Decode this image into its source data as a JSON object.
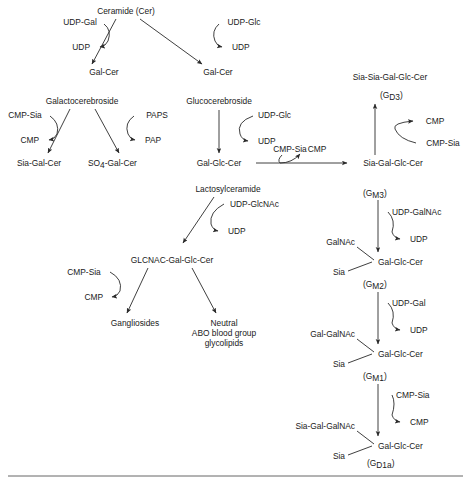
{
  "figure": {
    "background_color": "#ffffff",
    "line_color": "#2a2a2a",
    "text_color": "#1a1a1a"
  },
  "nodes": {
    "ceramide": "Ceramide (Cer)",
    "udp_gal_top": "UDP-Gal",
    "udp_glc_top": "UDP-Glc",
    "udp_left_top": "UDP",
    "udp_right_top": "UDP",
    "gal_cer_left": "Gal-Cer",
    "gal_cer_right": "Gal-Cer",
    "galactocerebroside": "Galactocerebroside",
    "glucocerebroside": "Glucocerebroside",
    "cmp_sia_left": "CMP-Sia",
    "cmp_left": "CMP",
    "sia_gal_cer": "Sia-Gal-Cer",
    "paps": "PAPS",
    "pap": "PAP",
    "so4_gal_cer_prefix": "SO",
    "so4_gal_cer_sub": "4",
    "so4_gal_cer_suffix": "-Gal-Cer",
    "udp_glc_mid": "UDP-Glc",
    "udp_mid": "UDP",
    "gal_glc_cer_mid": "Gal-Glc-Cer",
    "cmp_sia_horiz": "CMP-Sia",
    "cmp_horiz": "CMP",
    "sia_gal_glc_cer": "Sia-Gal-Glc-Cer",
    "sia_sia_gal_glc_cer": "Sia-Sia-Gal-Glc-Cer",
    "gd3_open": "(G",
    "gd3_sub": "D3",
    "gd3_close": ")",
    "cmp_gd3": "CMP",
    "cmp_sia_gd3": "CMP-Sia",
    "lactosylceramide": "Lactosylceramide",
    "udp_glcnac": "UDP-GlcNAc",
    "udp_lacto": "UDP",
    "glcnac_gal_glc_cer": "GLCNAC-Gal-Glc-Cer",
    "cmp_sia_gang": "CMP-Sia",
    "cmp_gang": "CMP",
    "gangliosides": "Gangliosides",
    "neutral_line1": "Neutral",
    "neutral_line2": "ABO blood group",
    "neutral_line3": "glycolipids",
    "gm3_open": "(G",
    "gm3_sub": "M3",
    "gm3_close": ")",
    "udp_galnac_gm3": "UDP-GalNAc",
    "udp_gm3": "UDP",
    "galnac_gm2": "GalNAc",
    "sia_gm2": "Sia",
    "gal_glc_cer_gm2": "Gal-Glc-Cer",
    "gm2_open": "(G",
    "gm2_sub": "M2",
    "gm2_close": ")",
    "udp_gal_gm2": "UDP-Gal",
    "udp_gm2": "UDP",
    "gal_galnac_gm1": "Gal-GalNAc",
    "sia_gm1": "Sia",
    "gal_glc_cer_gm1": "Gal-Glc-Cer",
    "gm1_open": "(G",
    "gm1_sub": "M1",
    "gm1_close": ")",
    "cmp_sia_gd1a": "CMP-Sia",
    "cmp_gd1a": "CMP",
    "sia_gal_galnac_gd1a": "Sia-Gal-GalNAc",
    "sia_gd1a": "Sia",
    "gal_glc_cer_gd1a": "Gal-Glc-Cer",
    "gd1a_open": "(G",
    "gd1a_sub": "D1a",
    "gd1a_close": ")"
  }
}
